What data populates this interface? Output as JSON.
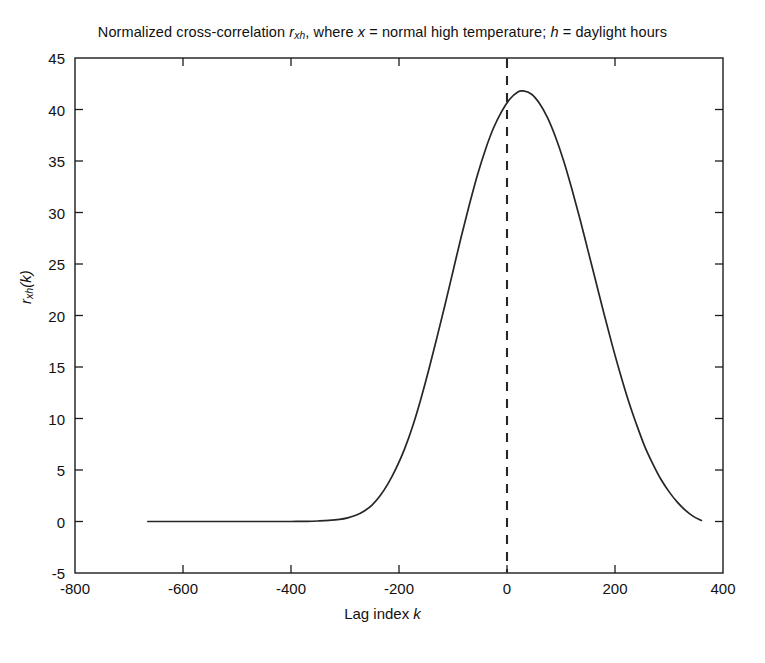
{
  "chart_data": {
    "type": "line",
    "title_parts": {
      "lead": "Normalized cross-correlation ",
      "symbol_base": "r",
      "symbol_sub": "xh",
      "mid": ", where ",
      "var_x": "x",
      "x_desc": " = normal high temperature; ",
      "var_h": "h",
      "h_desc": " = daylight hours"
    },
    "xlabel": "Lag index k",
    "xlabel_parts": {
      "text": "Lag index ",
      "var": "k"
    },
    "ylabel": "r_xh(k)",
    "ylabel_parts": {
      "base": "r",
      "sub": "xh",
      "arg": "(k)"
    },
    "xlim": [
      -800,
      400
    ],
    "ylim": [
      -5,
      45
    ],
    "xticks": [
      -800,
      -600,
      -400,
      -200,
      0,
      200,
      400
    ],
    "xtick_labels": [
      "-800",
      "-600",
      "-400",
      "-200",
      "0",
      "200",
      "400"
    ],
    "yticks": [
      -5,
      0,
      5,
      10,
      15,
      20,
      25,
      30,
      35,
      40,
      45
    ],
    "ytick_labels": [
      "-5",
      "0",
      "5",
      "10",
      "15",
      "20",
      "25",
      "30",
      "35",
      "40",
      "45"
    ],
    "grid": false,
    "legend": null,
    "box": true,
    "line_color": "#262626",
    "annotations": [
      {
        "name": "zero-lag-reference",
        "type": "vline",
        "x": 0,
        "style": "dashed",
        "color": "#262626"
      }
    ],
    "series": [
      {
        "name": "r_xh(k)",
        "color": "#262626",
        "style": "solid",
        "x": [
          -665,
          -640,
          -610,
          -580,
          -550,
          -520,
          -490,
          -460,
          -430,
          -400,
          -370,
          -350,
          -330,
          -310,
          -295,
          -280,
          -265,
          -250,
          -235,
          -220,
          -205,
          -190,
          -175,
          -160,
          -145,
          -130,
          -115,
          -100,
          -85,
          -70,
          -55,
          -40,
          -25,
          -10,
          5,
          20,
          30,
          45,
          60,
          75,
          90,
          105,
          120,
          135,
          150,
          165,
          180,
          195,
          210,
          225,
          240,
          255,
          270,
          285,
          300,
          315,
          330,
          345,
          360
        ],
        "y": [
          0.0,
          0.0,
          0.0,
          0.0,
          0.0,
          0.0,
          0.0,
          0.0,
          0.0,
          0.0,
          0.02,
          0.05,
          0.1,
          0.2,
          0.35,
          0.6,
          1.0,
          1.6,
          2.5,
          3.7,
          5.2,
          7.0,
          9.2,
          11.8,
          14.7,
          17.8,
          21.0,
          24.3,
          27.6,
          30.7,
          33.6,
          36.1,
          38.2,
          39.8,
          41.0,
          41.7,
          41.8,
          41.5,
          40.6,
          39.2,
          37.3,
          35.0,
          32.3,
          29.4,
          26.3,
          23.2,
          20.1,
          17.1,
          14.3,
          11.7,
          9.4,
          7.3,
          5.6,
          4.1,
          2.9,
          1.9,
          1.1,
          0.5,
          0.1
        ],
        "peak": {
          "x": 30,
          "y": 41.8
        },
        "value_at_zero_lag": 40.2
      }
    ]
  },
  "figure": {
    "background": "#ffffff",
    "axis_color": "#1c1c1c",
    "text_color": "#111111"
  }
}
